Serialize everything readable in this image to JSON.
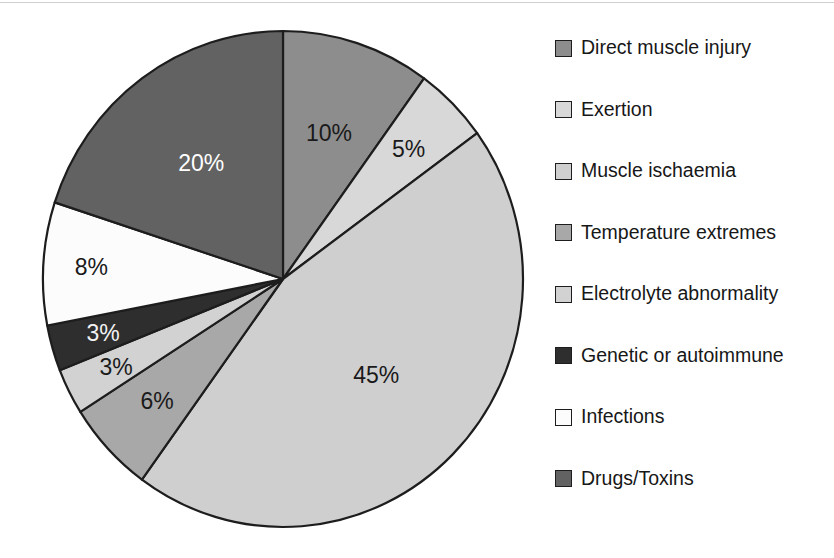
{
  "figure": {
    "type": "pie-chart-figure",
    "background": "#ffffff",
    "top_rule_color": "#cfcfcf"
  },
  "chart_data": {
    "type": "pie",
    "title": "",
    "subtitle": "",
    "xlabel": "",
    "ylabel": "",
    "grid": false,
    "legend_position": "right",
    "start_angle_deg": 0,
    "direction": "clockwise",
    "units": "percent",
    "total": 100,
    "categories": [
      "Direct muscle injury",
      "Exertion",
      "Muscle ischaemia",
      "Temperature extremes",
      "Electrolyte abnormality",
      "Genetic or autoimmune",
      "Infections",
      "Drugs/Toxins"
    ],
    "values": [
      10,
      5,
      45,
      6,
      3,
      3,
      8,
      20
    ],
    "data_labels": [
      "10%",
      "5%",
      "45%",
      "6%",
      "3%",
      "3%",
      "8%",
      "20%"
    ],
    "colors": [
      "#8d8d8d",
      "#d8d8d8",
      "#cfcfcf",
      "#a8a8a8",
      "#d2d2d2",
      "#2e2e2e",
      "#fcfcfc",
      "#626262"
    ],
    "label_text_colors": [
      "#1a1a1a",
      "#1a1a1a",
      "#1a1a1a",
      "#1a1a1a",
      "#1a1a1a",
      "#f2f2f2",
      "#1a1a1a",
      "#ffffff"
    ],
    "slice_outline_color": "#1d1d1d",
    "slices": [
      {
        "label": "Direct muscle injury",
        "value": 10,
        "data_label": "10%",
        "color": "#8d8d8d",
        "label_color": "#1a1a1a"
      },
      {
        "label": "Exertion",
        "value": 5,
        "data_label": "5%",
        "color": "#d8d8d8",
        "label_color": "#1a1a1a"
      },
      {
        "label": "Muscle ischaemia",
        "value": 45,
        "data_label": "45%",
        "color": "#cfcfcf",
        "label_color": "#1a1a1a"
      },
      {
        "label": "Temperature extremes",
        "value": 6,
        "data_label": "6%",
        "color": "#a8a8a8",
        "label_color": "#1a1a1a"
      },
      {
        "label": "Electrolyte abnormality",
        "value": 3,
        "data_label": "3%",
        "color": "#d2d2d2",
        "label_color": "#1a1a1a"
      },
      {
        "label": "Genetic or autoimmune",
        "value": 3,
        "data_label": "3%",
        "color": "#2e2e2e",
        "label_color": "#f2f2f2"
      },
      {
        "label": "Infections",
        "value": 8,
        "data_label": "8%",
        "color": "#fcfcfc",
        "label_color": "#1a1a1a"
      },
      {
        "label": "Drugs/Toxins",
        "value": 20,
        "data_label": "20%",
        "color": "#626262",
        "label_color": "#ffffff"
      }
    ]
  },
  "legend": {
    "items": [
      {
        "label": "Direct muscle injury",
        "color": "#8d8d8d"
      },
      {
        "label": "Exertion",
        "color": "#d8d8d8"
      },
      {
        "label": "Muscle ischaemia",
        "color": "#cfcfcf"
      },
      {
        "label": "Temperature extremes",
        "color": "#a8a8a8"
      },
      {
        "label": "Electrolyte abnormality",
        "color": "#d2d2d2"
      },
      {
        "label": "Genetic or autoimmune",
        "color": "#2e2e2e"
      },
      {
        "label": "Infections",
        "color": "#fcfcfc"
      },
      {
        "label": "Drugs/Toxins",
        "color": "#626262"
      }
    ]
  }
}
